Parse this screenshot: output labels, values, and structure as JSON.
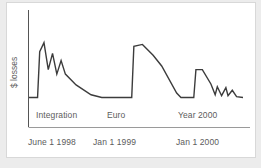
{
  "chart_data": {
    "type": "line",
    "title": "",
    "subtitle": "",
    "xlabel": "",
    "ylabel": "$ losses",
    "grid": false,
    "legend": "none",
    "x_tick_labels": [
      "June 1 1998",
      "Jan 1 1999",
      "Jan 1 2000"
    ],
    "annotations": [
      "Integration",
      "Euro",
      "Year 2000"
    ],
    "xlim": [
      "June 1 1998",
      "after Jan 1 2000"
    ],
    "ylim": [
      0,
      100
    ],
    "series": [
      {
        "name": "$ losses",
        "color": "#3c3c3c",
        "points": [
          {
            "x": 0,
            "y": 5
          },
          {
            "x": 4,
            "y": 5
          },
          {
            "x": 5,
            "y": 56
          },
          {
            "x": 7,
            "y": 66
          },
          {
            "x": 9,
            "y": 36
          },
          {
            "x": 11,
            "y": 54
          },
          {
            "x": 13,
            "y": 31
          },
          {
            "x": 15,
            "y": 46
          },
          {
            "x": 17,
            "y": 31
          },
          {
            "x": 22,
            "y": 19
          },
          {
            "x": 29,
            "y": 8
          },
          {
            "x": 34,
            "y": 5
          },
          {
            "x": 48,
            "y": 5
          },
          {
            "x": 49,
            "y": 62
          },
          {
            "x": 53,
            "y": 64
          },
          {
            "x": 58,
            "y": 52
          },
          {
            "x": 62,
            "y": 40
          },
          {
            "x": 69,
            "y": 10
          },
          {
            "x": 71,
            "y": 5
          },
          {
            "x": 77,
            "y": 5
          },
          {
            "x": 78,
            "y": 36
          },
          {
            "x": 81,
            "y": 36
          },
          {
            "x": 85,
            "y": 20
          },
          {
            "x": 87,
            "y": 8
          },
          {
            "x": 88,
            "y": 17
          },
          {
            "x": 90,
            "y": 7
          },
          {
            "x": 92,
            "y": 16
          },
          {
            "x": 93,
            "y": 7
          },
          {
            "x": 95,
            "y": 13
          },
          {
            "x": 97,
            "y": 6
          },
          {
            "x": 100,
            "y": 5
          }
        ]
      }
    ]
  },
  "axes": {
    "y_axis_label": "$ losses",
    "annotations": [
      {
        "name": "integration",
        "label": "Integration"
      },
      {
        "name": "euro",
        "label": "Euro"
      },
      {
        "name": "year-2000",
        "label": "Year 2000"
      }
    ],
    "x_ticks": [
      {
        "name": "june-1-1998",
        "label": "June 1 1998"
      },
      {
        "name": "jan-1-1999",
        "label": "Jan 1 1999"
      },
      {
        "name": "jan-1-2000",
        "label": "Jan 1 2000"
      }
    ]
  },
  "colors": {
    "series": "#3c3c3c",
    "axis": "#555555",
    "separator": "#9a9a9a",
    "text": "#5c5c5c",
    "card": "#ffffff",
    "background": "#ececec"
  }
}
